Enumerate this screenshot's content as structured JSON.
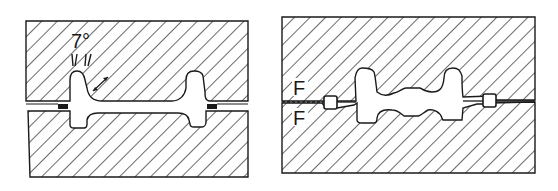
{
  "diagram": {
    "panels": [
      {
        "id": "left",
        "label_angle": "7°",
        "annotations": [
          "draft angle 7°",
          "fillet radius arrow",
          "flash at parting line"
        ]
      },
      {
        "id": "right",
        "labels": [
          "F",
          "F"
        ],
        "annotations": [
          "flash gutter",
          "parting line"
        ]
      }
    ],
    "colors": {
      "ink": "#1a1a1a",
      "background": "#ffffff"
    }
  }
}
